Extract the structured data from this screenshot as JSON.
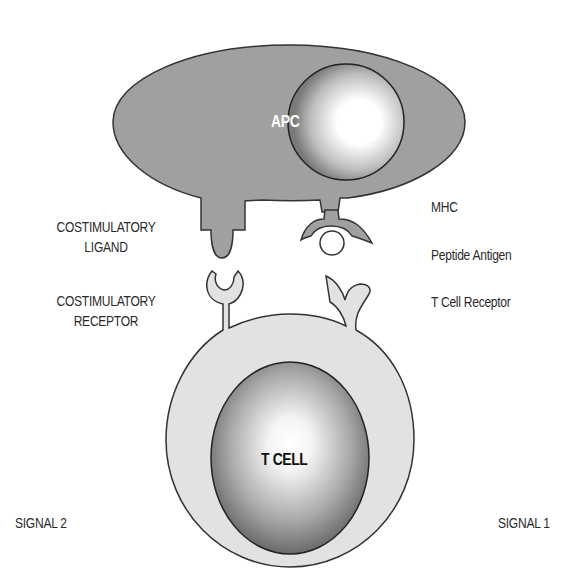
{
  "diagram": {
    "type": "two-signal T cell activation",
    "cells": {
      "apc": {
        "label": "APC",
        "membrane_color": "#a0a0a0",
        "label_color": "#ffffff"
      },
      "t_cell": {
        "label": "T CELL",
        "membrane_color": "#e0e0e0",
        "label_color": "#111111"
      }
    },
    "left_labels": {
      "costim_ligand": [
        "COSTIMULATORY",
        "LIGAND"
      ],
      "costim_receptor": [
        "COSTIMULATORY",
        "RECEPTOR"
      ],
      "signal": "SIGNAL 2"
    },
    "right_labels": {
      "mhc": "MHC",
      "peptide": "Peptide Antigen",
      "tcr": "T Cell Receptor",
      "signal": "SIGNAL 1"
    },
    "colors": {
      "outline": "#333333",
      "apc_fill": "#a0a0a0",
      "tcell_fill": "#e2e2e2",
      "nucleus_dark": "#707070",
      "nucleus_light": "#ffffff",
      "text": "#2a2a2a"
    }
  }
}
